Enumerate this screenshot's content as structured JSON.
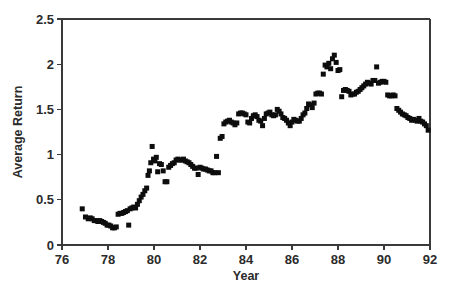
{
  "chart_data": {
    "type": "scatter",
    "title": "",
    "xlabel": "Year",
    "ylabel": "Average Return",
    "xlim": [
      76,
      92
    ],
    "ylim": [
      0,
      2.5
    ],
    "xticks": [
      76,
      78,
      80,
      82,
      84,
      86,
      88,
      90,
      92
    ],
    "xticklabels": [
      "76",
      "78",
      "80",
      "82",
      "84",
      "86",
      "88",
      "90",
      "92"
    ],
    "yticks": [
      0,
      0.5,
      1,
      1.5,
      2,
      2.5
    ],
    "yticklabels": [
      "0",
      "0.5",
      "1",
      "1.5",
      "2",
      "2.5"
    ],
    "grid": false,
    "legend": null,
    "marker": "square",
    "marker_color": "#0d0d0d",
    "marker_size": 5,
    "series": [
      {
        "name": "Average Return",
        "x": [
          76.88,
          77.02,
          77.14,
          77.23,
          77.31,
          77.4,
          77.48,
          77.56,
          77.64,
          77.72,
          77.8,
          77.88,
          77.96,
          78.04,
          78.12,
          78.2,
          78.28,
          78.36,
          78.44,
          78.52,
          78.6,
          78.68,
          78.76,
          78.84,
          78.9,
          78.96,
          79.04,
          79.12,
          79.2,
          79.28,
          79.36,
          79.44,
          79.52,
          79.6,
          79.68,
          79.74,
          79.8,
          79.86,
          79.92,
          79.98,
          80.04,
          80.1,
          80.16,
          80.24,
          80.32,
          80.4,
          80.48,
          80.56,
          80.64,
          80.72,
          80.8,
          80.88,
          80.96,
          81.04,
          81.12,
          81.2,
          81.28,
          81.36,
          81.44,
          81.52,
          81.6,
          81.68,
          81.76,
          81.84,
          81.92,
          82.0,
          82.08,
          82.16,
          82.24,
          82.32,
          82.4,
          82.48,
          82.56,
          82.64,
          82.72,
          82.8,
          82.88,
          82.96,
          83.04,
          83.12,
          83.2,
          83.28,
          83.36,
          83.44,
          83.52,
          83.6,
          83.68,
          83.76,
          83.84,
          83.92,
          84.0,
          84.08,
          84.16,
          84.24,
          84.32,
          84.4,
          84.48,
          84.56,
          84.64,
          84.72,
          84.8,
          84.88,
          84.96,
          85.04,
          85.12,
          85.2,
          85.28,
          85.36,
          85.44,
          85.52,
          85.6,
          85.68,
          85.76,
          85.84,
          85.92,
          86.0,
          86.08,
          86.16,
          86.24,
          86.32,
          86.4,
          86.48,
          86.56,
          86.64,
          86.72,
          86.8,
          86.88,
          86.96,
          87.04,
          87.12,
          87.2,
          87.28,
          87.36,
          87.44,
          87.52,
          87.6,
          87.68,
          87.76,
          87.84,
          87.92,
          88.0,
          88.08,
          88.16,
          88.24,
          88.32,
          88.4,
          88.48,
          88.56,
          88.64,
          88.72,
          88.8,
          88.88,
          88.96,
          89.04,
          89.12,
          89.2,
          89.28,
          89.36,
          89.44,
          89.52,
          89.6,
          89.68,
          89.76,
          89.84,
          89.92,
          90.0,
          90.08,
          90.16,
          90.24,
          90.32,
          90.4,
          90.48,
          90.56,
          90.64,
          90.72,
          90.8,
          90.88,
          90.96,
          91.04,
          91.12,
          91.2,
          91.28,
          91.36,
          91.44,
          91.52,
          91.6,
          91.68,
          91.76,
          91.84,
          91.92
        ],
        "y": [
          0.4,
          0.31,
          0.29,
          0.3,
          0.29,
          0.27,
          0.27,
          0.26,
          0.27,
          0.26,
          0.25,
          0.24,
          0.22,
          0.22,
          0.21,
          0.19,
          0.19,
          0.2,
          0.34,
          0.35,
          0.35,
          0.36,
          0.37,
          0.38,
          0.22,
          0.4,
          0.41,
          0.42,
          0.41,
          0.45,
          0.49,
          0.53,
          0.56,
          0.6,
          0.63,
          0.77,
          0.82,
          0.91,
          1.09,
          0.95,
          0.93,
          0.97,
          0.81,
          0.9,
          0.89,
          0.82,
          0.7,
          0.7,
          0.86,
          0.88,
          0.9,
          0.91,
          0.94,
          0.95,
          0.94,
          0.94,
          0.95,
          0.93,
          0.92,
          0.91,
          0.89,
          0.87,
          0.85,
          0.85,
          0.78,
          0.86,
          0.85,
          0.84,
          0.84,
          0.83,
          0.82,
          0.82,
          0.8,
          0.8,
          0.98,
          0.8,
          1.18,
          1.2,
          1.34,
          1.36,
          1.37,
          1.38,
          1.36,
          1.35,
          1.33,
          1.35,
          1.45,
          1.46,
          1.46,
          1.45,
          1.44,
          1.36,
          1.35,
          1.4,
          1.43,
          1.44,
          1.42,
          1.38,
          1.37,
          1.32,
          1.4,
          1.45,
          1.46,
          1.47,
          1.44,
          1.43,
          1.44,
          1.5,
          1.48,
          1.45,
          1.41,
          1.4,
          1.38,
          1.35,
          1.32,
          1.36,
          1.39,
          1.38,
          1.37,
          1.37,
          1.4,
          1.44,
          1.46,
          1.51,
          1.56,
          1.55,
          1.52,
          1.57,
          1.67,
          1.68,
          1.68,
          1.67,
          1.89,
          1.99,
          1.97,
          2.01,
          1.95,
          2.06,
          2.1,
          2.02,
          1.93,
          1.94,
          1.64,
          1.71,
          1.72,
          1.71,
          1.7,
          1.66,
          1.67,
          1.67,
          1.69,
          1.7,
          1.72,
          1.74,
          1.76,
          1.78,
          1.8,
          1.79,
          1.78,
          1.82,
          1.82,
          1.97,
          1.79,
          1.8,
          1.81,
          1.81,
          1.8,
          1.66,
          1.65,
          1.65,
          1.66,
          1.65,
          1.51,
          1.49,
          1.47,
          1.45,
          1.44,
          1.43,
          1.41,
          1.4,
          1.38,
          1.39,
          1.38,
          1.37,
          1.4,
          1.37,
          1.36,
          1.34,
          1.32,
          1.27
        ]
      }
    ]
  },
  "axes": {
    "ylabel": "Average Return",
    "xlabel": "Year"
  }
}
